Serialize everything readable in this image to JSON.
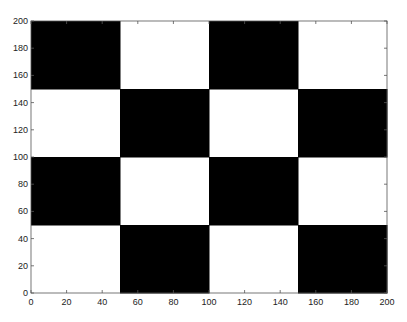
{
  "chart_data": {
    "type": "heatmap",
    "title": "",
    "xlabel": "",
    "ylabel": "",
    "xlim": [
      0,
      200
    ],
    "ylim": [
      0,
      200
    ],
    "grid": false,
    "legend": null,
    "xticks": [
      0,
      20,
      40,
      60,
      80,
      100,
      120,
      140,
      160,
      180,
      200
    ],
    "yticks": [
      0,
      20,
      40,
      60,
      80,
      100,
      120,
      140,
      160,
      180,
      200
    ],
    "cell_size": 50,
    "colors": {
      "filled": "#000000",
      "empty": "#ffffff"
    },
    "blocks": [
      {
        "x": [
          0,
          50
        ],
        "y": [
          150,
          200
        ],
        "value": 1
      },
      {
        "x": [
          50,
          100
        ],
        "y": [
          150,
          200
        ],
        "value": 0
      },
      {
        "x": [
          100,
          150
        ],
        "y": [
          150,
          200
        ],
        "value": 1
      },
      {
        "x": [
          150,
          200
        ],
        "y": [
          150,
          200
        ],
        "value": 0
      },
      {
        "x": [
          0,
          50
        ],
        "y": [
          100,
          150
        ],
        "value": 0
      },
      {
        "x": [
          50,
          100
        ],
        "y": [
          100,
          150
        ],
        "value": 1
      },
      {
        "x": [
          100,
          150
        ],
        "y": [
          100,
          150
        ],
        "value": 0
      },
      {
        "x": [
          150,
          200
        ],
        "y": [
          100,
          150
        ],
        "value": 1
      },
      {
        "x": [
          0,
          50
        ],
        "y": [
          50,
          100
        ],
        "value": 1
      },
      {
        "x": [
          50,
          100
        ],
        "y": [
          50,
          100
        ],
        "value": 0
      },
      {
        "x": [
          100,
          150
        ],
        "y": [
          50,
          100
        ],
        "value": 1
      },
      {
        "x": [
          150,
          200
        ],
        "y": [
          50,
          100
        ],
        "value": 0
      },
      {
        "x": [
          0,
          50
        ],
        "y": [
          0,
          50
        ],
        "value": 0
      },
      {
        "x": [
          50,
          100
        ],
        "y": [
          0,
          50
        ],
        "value": 1
      },
      {
        "x": [
          100,
          150
        ],
        "y": [
          0,
          50
        ],
        "value": 0
      },
      {
        "x": [
          150,
          200
        ],
        "y": [
          0,
          50
        ],
        "value": 1
      }
    ]
  }
}
